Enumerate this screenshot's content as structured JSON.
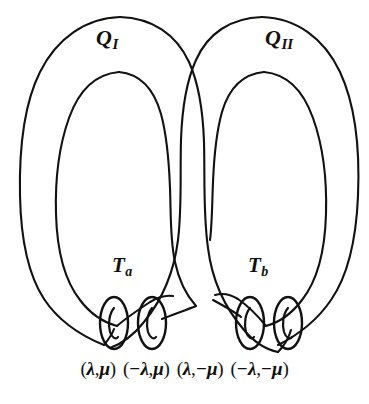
{
  "figure": {
    "type": "topology-diagram",
    "background_color": "#ffffff",
    "stroke_color": "#111111"
  },
  "regions": [
    {
      "name": "region-q-one",
      "base": "Q",
      "subscript": "I"
    },
    {
      "name": "region-q-two",
      "base": "Q",
      "subscript": "II"
    }
  ],
  "tubes": [
    {
      "name": "tube-t-a",
      "base": "T",
      "subscript": "a"
    },
    {
      "name": "tube-t-b",
      "base": "T",
      "subscript": "b"
    }
  ],
  "coordinates": [
    {
      "open": "(",
      "first": "λ",
      "comma": ",",
      "second": "μ",
      "close": ")",
      "text": "(λ,μ)"
    },
    {
      "open": "(",
      "first": "−λ",
      "comma": ",",
      "second": "μ",
      "close": ")",
      "text": "(−λ,μ)"
    },
    {
      "open": "(",
      "first": "λ",
      "comma": ",",
      "second": "−μ",
      "close": ")",
      "text": "(λ,−μ)"
    },
    {
      "open": "(",
      "first": "−λ",
      "comma": ",",
      "second": "−μ",
      "close": ")",
      "text": "(−λ,−μ)"
    }
  ],
  "cross_sections": [
    {
      "name": "ellipse-lambda-mu",
      "cx": 114,
      "cy": 323,
      "rx": 14,
      "ry": 26
    },
    {
      "name": "ellipse-neg-lambda-mu",
      "cx": 152,
      "cy": 323,
      "rx": 14,
      "ry": 26
    },
    {
      "name": "ellipse-lambda-neg-mu",
      "cx": 250,
      "cy": 323,
      "rx": 14,
      "ry": 26
    },
    {
      "name": "ellipse-neg-lambda-neg-mu",
      "cx": 288,
      "cy": 323,
      "rx": 14,
      "ry": 26
    }
  ]
}
